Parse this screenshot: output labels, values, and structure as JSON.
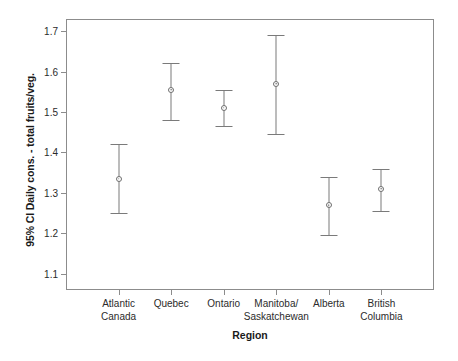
{
  "chart_data": {
    "type": "scatter",
    "title": "",
    "subtitle": "",
    "xlabel": "Region",
    "ylabel": "95% CI Daily cons. - total fruits/veg.",
    "categories": [
      "Atlantic\nCanada",
      "Quebec",
      "Ontario",
      "Manitoba/\nSaskatchewan",
      "Alberta",
      "British\nColumbia"
    ],
    "category_lines": [
      [
        "Atlantic",
        "Canada"
      ],
      [
        "Quebec",
        ""
      ],
      [
        "Ontario",
        ""
      ],
      [
        "Manitoba/",
        "Saskatchewan"
      ],
      [
        "Alberta",
        ""
      ],
      [
        "British",
        "Columbia"
      ]
    ],
    "values": [
      1.335,
      1.555,
      1.51,
      1.57,
      1.27,
      1.31
    ],
    "error_low": [
      1.25,
      1.48,
      1.465,
      1.445,
      1.195,
      1.255
    ],
    "error_high": [
      1.42,
      1.62,
      1.555,
      1.69,
      1.34,
      1.36
    ],
    "ylim": [
      1.06,
      1.73
    ],
    "xlim": [
      0,
      7
    ],
    "yticks": [
      1.1,
      1.2,
      1.3,
      1.4,
      1.5,
      1.6,
      1.7
    ],
    "ytick_labels": [
      "1.1",
      "1.2",
      "1.3",
      "1.4",
      "1.5",
      "1.6",
      "1.7"
    ],
    "grid": false,
    "legend": false,
    "legend_position": "none",
    "marker": "open-circle",
    "errorbar_type": "95% confidence interval",
    "colors": {
      "marker_outline": "#6e6e6e",
      "errorbar": "#7a7a7a",
      "frame": "#8c8c8c",
      "text": "#1a1a1a",
      "background": "#ffffff"
    }
  }
}
